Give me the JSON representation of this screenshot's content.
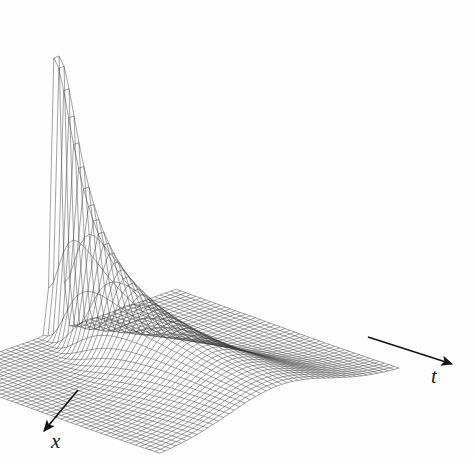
{
  "figure": {
    "kind": "3d-surface-wireframe",
    "background_color": "#fdfdfd",
    "mesh_color": "#3a3a3a",
    "arrow_color": "#141414",
    "width": 474,
    "height": 463
  },
  "axes": {
    "x_axis": {
      "label": "x",
      "arrow_from": [
        78,
        390
      ],
      "arrow_to": [
        44,
        431
      ],
      "label_pos": [
        51,
        431
      ]
    },
    "t_axis": {
      "label": "t",
      "arrow_from": [
        368,
        337
      ],
      "arrow_to": [
        452,
        364
      ],
      "label_pos": [
        431,
        366
      ]
    }
  },
  "chart_data": {
    "type": "surface",
    "title": "",
    "xlabel": "x",
    "ylabel": "t",
    "zlabel": "",
    "grid": true,
    "legend": "none",
    "function": "u(x,t) = exp(-x^2/(4t)) / sqrt(4*pi*t)",
    "nx": 46,
    "nt": 46,
    "xlim": [
      -6,
      6
    ],
    "tlim": [
      0.02,
      3.2
    ],
    "zlim": [
      0,
      2.1
    ],
    "projection": {
      "type": "oblique-axonometric",
      "x_axis_screen_vector": [
        -5.2,
        1.85
      ],
      "t_axis_screen_vector": [
        4.85,
        1.75
      ],
      "z_axis_screen_vector": [
        0,
        -1.0
      ],
      "origin_screen": [
        168,
        372
      ]
    },
    "surface_extent_screen": {
      "left_corner": [
        22,
        356
      ],
      "top_corner_back": [
        245,
        191
      ],
      "right_corner": [
        456,
        268
      ],
      "bottom_corner": [
        296,
        438
      ],
      "peak_apex": [
        162,
        14
      ]
    },
    "peak": {
      "apex_screen": [
        162,
        14
      ],
      "apex_value_z": 2.05,
      "location_x": 0.0,
      "location_t": 0.02
    },
    "sample_profiles": [
      {
        "t": 0.02,
        "x": [
          -2.0,
          -1.0,
          -0.4,
          0.0,
          0.4,
          1.0,
          2.0
        ],
        "z": [
          0.0,
          0.0,
          0.07,
          1.99,
          0.07,
          0.0,
          0.0
        ]
      },
      {
        "t": 0.1,
        "x": [
          -2.0,
          -1.0,
          -0.4,
          0.0,
          0.4,
          1.0,
          2.0
        ],
        "z": [
          0.0,
          0.07,
          0.72,
          0.89,
          0.72,
          0.07,
          0.0
        ]
      },
      {
        "t": 0.4,
        "x": [
          -2.0,
          -1.0,
          -0.4,
          0.0,
          0.4,
          1.0,
          2.0
        ],
        "z": [
          0.03,
          0.31,
          0.42,
          0.45,
          0.42,
          0.31,
          0.03
        ]
      },
      {
        "t": 1.0,
        "x": [
          -2.0,
          -1.0,
          -0.4,
          0.0,
          0.4,
          1.0,
          2.0
        ],
        "z": [
          0.1,
          0.22,
          0.27,
          0.28,
          0.27,
          0.22,
          0.1
        ]
      },
      {
        "t": 2.0,
        "x": [
          -2.0,
          -1.0,
          -0.4,
          0.0,
          0.4,
          1.0,
          2.0
        ],
        "z": [
          0.12,
          0.18,
          0.19,
          0.2,
          0.19,
          0.18,
          0.12
        ]
      },
      {
        "t": 3.2,
        "x": [
          -2.0,
          -1.0,
          -0.4,
          0.0,
          0.4,
          1.0,
          2.0
        ],
        "z": [
          0.11,
          0.15,
          0.16,
          0.16,
          0.16,
          0.15,
          0.11
        ]
      }
    ]
  }
}
